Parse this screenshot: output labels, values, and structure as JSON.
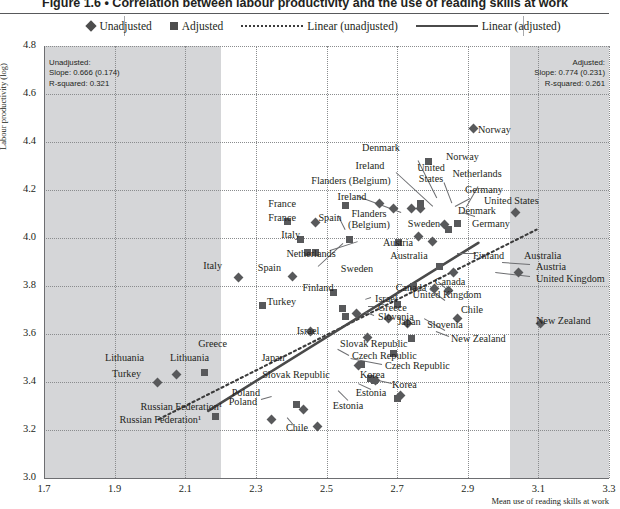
{
  "figure": {
    "title": "Figure 1.6 • Correlation between labour productivity and the use of reading skills at work",
    "title_number": "Figure 1.6",
    "title_bullet": "•",
    "title_text": "Correlation between labour productivity and the use of reading skills at work"
  },
  "legend": {
    "items": [
      {
        "label": "Unadjusted",
        "icon": "diamond-marker",
        "color": "#4d4d4d"
      },
      {
        "label": "Adjusted",
        "icon": "square-marker",
        "color": "#4d4d4d"
      },
      {
        "label": "Linear (unadjusted)",
        "icon": "dotted-line",
        "color": "#3b3b3b"
      },
      {
        "label": "Linear (adjusted)",
        "icon": "solid-line",
        "color": "#4a4a4a"
      }
    ]
  },
  "annotations": {
    "unadjusted": {
      "title": "Unadjusted:",
      "slope": "Slope: 0.666 (0.174)",
      "rsquared": "R-squared: 0.321"
    },
    "adjusted": {
      "title": "Adjusted:",
      "slope": "Slope: 0.774 (0.231)",
      "rsquared": "R-squared: 0.261"
    }
  },
  "chart_data": {
    "type": "scatter",
    "title": "Correlation between labour productivity and the use of reading skills at work",
    "xlabel": "Mean use of reading skills at work",
    "ylabel": "Labour productivity (log)",
    "xlim": [
      1.7,
      3.3
    ],
    "ylim": [
      3.0,
      4.8
    ],
    "xticks": [
      "1.7",
      "1.9",
      "2.1",
      "2.3",
      "2.5",
      "2.7",
      "2.9",
      "3.1",
      "3.3"
    ],
    "yticks": [
      "3.0",
      "3.2",
      "3.4",
      "3.6",
      "3.8",
      "4.0",
      "4.2",
      "4.4",
      "4.6",
      "4.8"
    ],
    "grid": true,
    "legend_position": "top",
    "shaded_bands": [
      {
        "from": 1.7,
        "to": 2.2,
        "color": "#d5d6d8"
      },
      {
        "from": 3.02,
        "to": 3.3,
        "color": "#d5d6d8"
      }
    ],
    "series": [
      {
        "name": "Unadjusted",
        "marker": "diamond",
        "points": [
          {
            "country": "Norway",
            "x": 2.915,
            "y": 4.455
          },
          {
            "country": "United States",
            "x": 3.035,
            "y": 4.105
          },
          {
            "country": "Australia",
            "x": 3.045,
            "y": 3.855
          },
          {
            "country": "New Zealand",
            "x": 3.105,
            "y": 3.645
          },
          {
            "country": "Germany",
            "x": 2.835,
            "y": 4.055
          },
          {
            "country": "Netherlands",
            "x": 2.765,
            "y": 4.125
          },
          {
            "country": "Denmark",
            "x": 2.74,
            "y": 4.125
          },
          {
            "country": "Ireland",
            "x": 2.65,
            "y": 4.145
          },
          {
            "country": "Flanders (Belgium)",
            "x": 2.69,
            "y": 4.125
          },
          {
            "country": "Sweden",
            "x": 2.76,
            "y": 4.005
          },
          {
            "country": "Austria",
            "x": 2.8,
            "y": 3.985
          },
          {
            "country": "France",
            "x": 2.47,
            "y": 4.065
          },
          {
            "country": "Spain",
            "x": 2.405,
            "y": 3.84
          },
          {
            "country": "Italy",
            "x": 2.25,
            "y": 3.835
          },
          {
            "country": "Finland",
            "x": 2.86,
            "y": 3.855
          },
          {
            "country": "Canada",
            "x": 2.805,
            "y": 3.79
          },
          {
            "country": "United Kingdom",
            "x": 2.845,
            "y": 3.78
          },
          {
            "country": "Chile",
            "x": 2.87,
            "y": 3.665
          },
          {
            "country": "Japan",
            "x": 2.73,
            "y": 3.645
          },
          {
            "country": "Slovenia",
            "x": 2.675,
            "y": 3.665
          },
          {
            "country": "Israel",
            "x": 2.585,
            "y": 3.685
          },
          {
            "country": "Greece",
            "x": 2.455,
            "y": 3.61
          },
          {
            "country": "Slovak Republic",
            "x": 2.615,
            "y": 3.585
          },
          {
            "country": "Czech Republic",
            "x": 2.59,
            "y": 3.47
          },
          {
            "country": "Korea",
            "x": 2.64,
            "y": 3.405
          },
          {
            "country": "Estonia",
            "x": 2.71,
            "y": 3.345
          },
          {
            "country": "Lithuania",
            "x": 2.075,
            "y": 3.43
          },
          {
            "country": "Turkey",
            "x": 2.02,
            "y": 3.4
          },
          {
            "country": "Poland",
            "x": 2.435,
            "y": 3.285
          },
          {
            "country": "Russian Federation",
            "x": 2.345,
            "y": 3.245
          },
          {
            "country": "Chile",
            "x": 2.475,
            "y": 3.215
          }
        ]
      },
      {
        "name": "Adjusted",
        "marker": "square",
        "points": [
          {
            "country": "Norway",
            "x": 2.79,
            "y": 4.32
          },
          {
            "country": "United States",
            "x": 2.765,
            "y": 4.145
          },
          {
            "country": "Germany",
            "x": 2.87,
            "y": 4.06
          },
          {
            "country": "Denmark",
            "x": 2.845,
            "y": 4.035
          },
          {
            "country": "Ireland",
            "x": 2.555,
            "y": 4.135
          },
          {
            "country": "France",
            "x": 2.39,
            "y": 4.07
          },
          {
            "country": "Flanders (Belgium)",
            "x": 2.565,
            "y": 3.995
          },
          {
            "country": "Sweden",
            "x": 2.705,
            "y": 3.98
          },
          {
            "country": "Italy",
            "x": 2.425,
            "y": 3.995
          },
          {
            "country": "Netherlands",
            "x": 2.445,
            "y": 3.94
          },
          {
            "country": "Austria",
            "x": 2.47,
            "y": 3.94
          },
          {
            "country": "Australia",
            "x": 2.82,
            "y": 3.88
          },
          {
            "country": "Canada",
            "x": 2.745,
            "y": 3.8
          },
          {
            "country": "Finland",
            "x": 2.52,
            "y": 3.775
          },
          {
            "country": "United Kingdom",
            "x": 2.7,
            "y": 3.725
          },
          {
            "country": "Turkey",
            "x": 2.32,
            "y": 3.72
          },
          {
            "country": "Israel",
            "x": 2.545,
            "y": 3.705
          },
          {
            "country": "Slovenia",
            "x": 2.555,
            "y": 3.675
          },
          {
            "country": "New Zealand",
            "x": 2.74,
            "y": 3.58
          },
          {
            "country": "Slovak Republic",
            "x": 2.69,
            "y": 3.52
          },
          {
            "country": "Japan",
            "x": 2.6,
            "y": 3.475
          },
          {
            "country": "Czech Republic",
            "x": 2.625,
            "y": 3.415
          },
          {
            "country": "Korea",
            "x": 2.635,
            "y": 3.405
          },
          {
            "country": "Lithuania",
            "x": 2.155,
            "y": 3.44
          },
          {
            "country": "Estonia",
            "x": 2.7,
            "y": 3.33
          },
          {
            "country": "Poland",
            "x": 2.415,
            "y": 3.305
          },
          {
            "country": "Russian Federation",
            "x": 2.185,
            "y": 3.255
          }
        ]
      }
    ],
    "trendlines": [
      {
        "name": "Linear (unadjusted)",
        "style": "dotted",
        "x0": 2.025,
        "y0": 3.245,
        "x1": 3.095,
        "y1": 4.035
      },
      {
        "name": "Linear (adjusted)",
        "style": "solid",
        "x0": 2.165,
        "y0": 3.28,
        "x1": 2.93,
        "y1": 3.98
      }
    ],
    "labels": [
      {
        "text": "Norway",
        "x": 478,
        "y": 130,
        "align": "l"
      },
      {
        "text": "Norway",
        "x": 446,
        "y": 157,
        "align": "l"
      },
      {
        "text": "Denmark",
        "x": 381,
        "y": 148,
        "align": "c"
      },
      {
        "text": "Ireland",
        "x": 370,
        "y": 166,
        "align": "c"
      },
      {
        "text": "United\nStates",
        "x": 431,
        "y": 174,
        "align": "c"
      },
      {
        "text": "Netherlands",
        "x": 477,
        "y": 174,
        "align": "c"
      },
      {
        "text": "Flanders (Belgium)",
        "x": 351,
        "y": 181,
        "align": "c"
      },
      {
        "text": "Germany",
        "x": 484,
        "y": 190,
        "align": "c"
      },
      {
        "text": "United States",
        "x": 484,
        "y": 201,
        "align": "l"
      },
      {
        "text": "Ireland",
        "x": 352,
        "y": 197,
        "align": "c"
      },
      {
        "text": "France",
        "x": 296,
        "y": 204,
        "align": "r"
      },
      {
        "text": "Denmark",
        "x": 477,
        "y": 211,
        "align": "c"
      },
      {
        "text": "Spain",
        "x": 330,
        "y": 218,
        "align": "c"
      },
      {
        "text": "France",
        "x": 296,
        "y": 218,
        "align": "r"
      },
      {
        "text": "Flanders\n(Belgium)",
        "x": 369,
        "y": 220,
        "align": "c"
      },
      {
        "text": "Sweden",
        "x": 424,
        "y": 224,
        "align": "c"
      },
      {
        "text": "Germany",
        "x": 491,
        "y": 224,
        "align": "c"
      },
      {
        "text": "Italy",
        "x": 300,
        "y": 235,
        "align": "r"
      },
      {
        "text": "Austria",
        "x": 398,
        "y": 243,
        "align": "c"
      },
      {
        "text": "Netherlands",
        "x": 311,
        "y": 254,
        "align": "c"
      },
      {
        "text": "Australia",
        "x": 409,
        "y": 256,
        "align": "c"
      },
      {
        "text": "Italy",
        "x": 222,
        "y": 266,
        "align": "r"
      },
      {
        "text": "Spain",
        "x": 281,
        "y": 268,
        "align": "r"
      },
      {
        "text": "Sweden",
        "x": 357,
        "y": 269,
        "align": "c"
      },
      {
        "text": "Finland",
        "x": 473,
        "y": 256,
        "align": "l"
      },
      {
        "text": "Australia",
        "x": 524,
        "y": 256,
        "align": "l"
      },
      {
        "text": "Austria",
        "x": 536,
        "y": 267,
        "align": "l"
      },
      {
        "text": "United Kingdom",
        "x": 536,
        "y": 279,
        "align": "l"
      },
      {
        "text": "Finland",
        "x": 318,
        "y": 288,
        "align": "c"
      },
      {
        "text": "Canada",
        "x": 411,
        "y": 288,
        "align": "c"
      },
      {
        "text": "Canada",
        "x": 450,
        "y": 282,
        "align": "c"
      },
      {
        "text": "United Kingdom",
        "x": 447,
        "y": 295,
        "align": "c"
      },
      {
        "text": "Israel",
        "x": 375,
        "y": 299,
        "align": "l"
      },
      {
        "text": "Turkey",
        "x": 296,
        "y": 302,
        "align": "r"
      },
      {
        "text": "Greece",
        "x": 378,
        "y": 308,
        "align": "l"
      },
      {
        "text": "Slovenia",
        "x": 378,
        "y": 317,
        "align": "l"
      },
      {
        "text": "Chile",
        "x": 461,
        "y": 310,
        "align": "l"
      },
      {
        "text": "New Zealand",
        "x": 536,
        "y": 321,
        "align": "l"
      },
      {
        "text": "Japan",
        "x": 409,
        "y": 322,
        "align": "c"
      },
      {
        "text": "Slovenia",
        "x": 445,
        "y": 325,
        "align": "c"
      },
      {
        "text": "Israel",
        "x": 308,
        "y": 331,
        "align": "c"
      },
      {
        "text": "Greece",
        "x": 227,
        "y": 344,
        "align": "r"
      },
      {
        "text": "Slovak Republic",
        "x": 340,
        "y": 344,
        "align": "l"
      },
      {
        "text": "New Zealand",
        "x": 451,
        "y": 339,
        "align": "l"
      },
      {
        "text": "Lithuania",
        "x": 144,
        "y": 358,
        "align": "r"
      },
      {
        "text": "Lithuania",
        "x": 170,
        "y": 358,
        "align": "l"
      },
      {
        "text": "Japan",
        "x": 273,
        "y": 358,
        "align": "c"
      },
      {
        "text": "Czech Republic",
        "x": 352,
        "y": 356,
        "align": "l"
      },
      {
        "text": "Czech Republic",
        "x": 385,
        "y": 366,
        "align": "l"
      },
      {
        "text": "Turkey",
        "x": 141,
        "y": 374,
        "align": "r"
      },
      {
        "text": "Slovak Republic",
        "x": 296,
        "y": 375,
        "align": "c"
      },
      {
        "text": "Korea",
        "x": 360,
        "y": 375,
        "align": "l"
      },
      {
        "text": "Korea",
        "x": 392,
        "y": 385,
        "align": "l"
      },
      {
        "text": "Estonia",
        "x": 371,
        "y": 393,
        "align": "c"
      },
      {
        "text": "Poland",
        "x": 260,
        "y": 393,
        "align": "r"
      },
      {
        "text": "Poland",
        "x": 257,
        "y": 402,
        "align": "r"
      },
      {
        "text": "Estonia",
        "x": 348,
        "y": 406,
        "align": "c"
      },
      {
        "text": "Russian Federation¹",
        "x": 222,
        "y": 407,
        "align": "r"
      },
      {
        "text": "Russian Federation¹",
        "x": 201,
        "y": 420,
        "align": "r"
      },
      {
        "text": "Chile",
        "x": 297,
        "y": 428,
        "align": "c"
      }
    ]
  }
}
